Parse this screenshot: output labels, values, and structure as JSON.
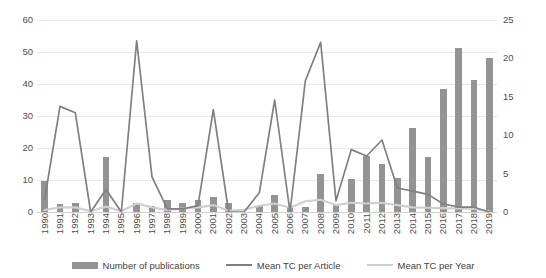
{
  "chart_data": {
    "type": "bar",
    "title": "",
    "xlabel": "",
    "ylabel": "",
    "grid": true,
    "legend_position": "bottom",
    "categories": [
      "1990",
      "1991",
      "1992",
      "1993",
      "1994",
      "1995",
      "1996",
      "1997",
      "1998",
      "1999",
      "2000",
      "2001",
      "2002",
      "2003",
      "2004",
      "2005",
      "2006",
      "2007",
      "2008",
      "2009",
      "2010",
      "2011",
      "2012",
      "2013",
      "2014",
      "2015",
      "2016",
      "2017",
      "2018",
      "2019"
    ],
    "axes": {
      "left": {
        "label": "",
        "min": 0,
        "max": 60,
        "ticks": [
          0,
          10,
          20,
          30,
          40,
          50,
          60
        ],
        "used_by": [
          "Mean TC per Article"
        ]
      },
      "right": {
        "label": "",
        "min": 0,
        "max": 25,
        "ticks": [
          0,
          5,
          10,
          15,
          20,
          25
        ],
        "used_by": [
          "Number of publications",
          "Mean TC per Year"
        ]
      }
    },
    "series": [
      {
        "name": "Number of publications",
        "type": "bar",
        "axis": "right",
        "color": "#939393",
        "values": [
          4,
          1,
          1.2,
          0,
          7.2,
          0,
          1.2,
          0.8,
          1.6,
          1.2,
          1.5,
          2,
          1.2,
          0,
          0.8,
          2.2,
          0.6,
          0.6,
          5,
          1,
          4.3,
          7.3,
          6.3,
          4.4,
          11,
          7.2,
          16,
          21.3,
          17.2,
          20
        ]
      },
      {
        "name": "Mean TC per Article",
        "type": "line",
        "axis": "left",
        "color": "#808080",
        "values": [
          4,
          33,
          31,
          0,
          7,
          0,
          53.5,
          11,
          1,
          1,
          2,
          32,
          0,
          0,
          6,
          35,
          0,
          41,
          53,
          3.5,
          19.5,
          17.5,
          22.5,
          7.5,
          6.5,
          5.5,
          2.5,
          1.5,
          1.5,
          0
        ]
      },
      {
        "name": "Mean TC per Year",
        "type": "line",
        "axis": "right",
        "color": "#cfcfcf",
        "values": [
          0.25,
          0.6,
          0.6,
          0.1,
          0.7,
          0.1,
          1.1,
          0.6,
          0.25,
          0.45,
          0.6,
          0.9,
          0.15,
          0.3,
          0.8,
          1.1,
          0.55,
          1.4,
          1.6,
          0.9,
          1.2,
          1.1,
          1.2,
          0.9,
          0.6,
          0.55,
          0.5,
          0.45,
          0.4,
          0.1
        ]
      }
    ]
  },
  "axis_labels": {
    "left_ticks": [
      "60",
      "50",
      "40",
      "30",
      "20",
      "10",
      "0"
    ],
    "right_ticks": [
      "25",
      "20",
      "15",
      "10",
      "5",
      "0"
    ]
  },
  "legend": {
    "items": [
      {
        "label": "Number of publications",
        "marker": "bar-swatch"
      },
      {
        "label": "Mean TC per Article",
        "marker": "line-swatch-dark"
      },
      {
        "label": "Mean TC per Year",
        "marker": "line-swatch-light"
      }
    ]
  }
}
